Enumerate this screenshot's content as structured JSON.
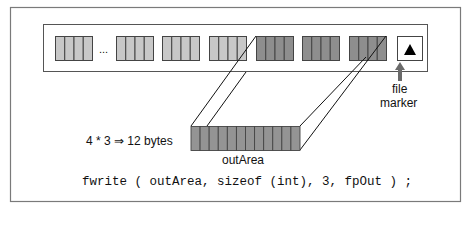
{
  "figure": {
    "file_strip": {
      "ellipsis": "...",
      "groups": [
        {
          "x": 55,
          "shade": "light"
        },
        {
          "x": 116,
          "shade": "light"
        },
        {
          "x": 162,
          "shade": "light"
        },
        {
          "x": 209,
          "shade": "light"
        },
        {
          "x": 256,
          "shade": "dark"
        },
        {
          "x": 302,
          "shade": "dark"
        },
        {
          "x": 349,
          "shade": "dark"
        }
      ],
      "cells_per_group": 4,
      "end_of_file_marker_icon": "black-triangle-icon"
    },
    "file_marker_label_line1": "file",
    "file_marker_label_line2": "marker",
    "byte_count_label": "4 * 3 ⇒ 12 bytes",
    "buffer": {
      "label": "outArea",
      "cells": 12
    },
    "code_line": "fwrite ( outArea, sizeof (int), 3, fpOut ) ;",
    "colors": {
      "light_cell": "#c8c8c8",
      "dark_cell": "#8e8e8e",
      "buffer_cell": "#949494",
      "border": "#444444",
      "frame": "#7a7a7a",
      "arrow": "#6a6a6a"
    }
  }
}
